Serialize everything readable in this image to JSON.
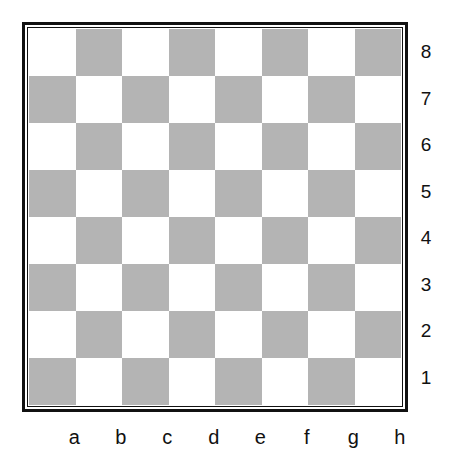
{
  "board": {
    "colors": {
      "light": "#ffffff",
      "dark": "#b4b4b4",
      "border": "#111111"
    },
    "ranks": [
      "8",
      "7",
      "6",
      "5",
      "4",
      "3",
      "2",
      "1"
    ],
    "files": [
      "a",
      "b",
      "c",
      "d",
      "e",
      "f",
      "g",
      "h"
    ],
    "pieces": []
  }
}
